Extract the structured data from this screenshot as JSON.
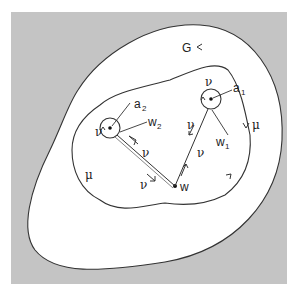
{
  "diagram": {
    "background_color": "#c4c4c4",
    "region_fill": "#ffffff",
    "stroke_color": "#333333",
    "region_label": "G",
    "points": {
      "w": "w",
      "a1": "a",
      "a1_sub": "1",
      "a2": "a",
      "a2_sub": "2",
      "w1": "w",
      "w1_sub": "1",
      "w2": "w",
      "w2_sub": "2"
    },
    "contour_labels": {
      "mu": "μ",
      "nu": "ν"
    }
  }
}
